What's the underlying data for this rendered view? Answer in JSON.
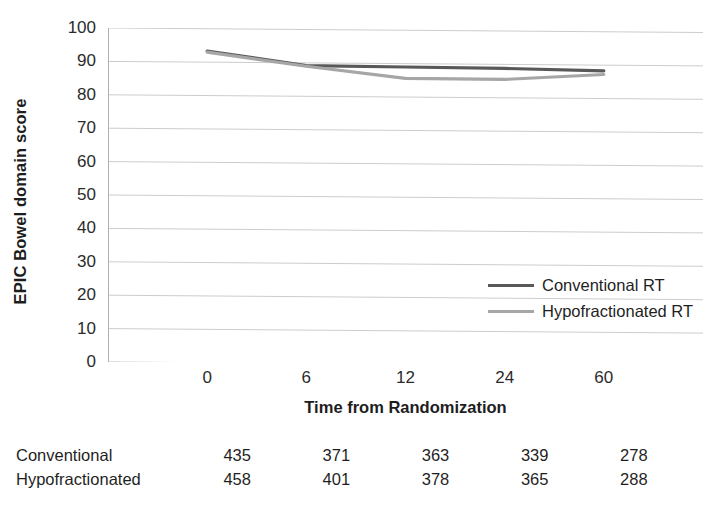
{
  "chart_data": {
    "type": "line",
    "title": "",
    "xlabel": "Time from Randomization",
    "ylabel": "EPIC Bowel domain score",
    "categories": [
      "0",
      "6",
      "12",
      "24",
      "60"
    ],
    "ylim": [
      0,
      100
    ],
    "ytick_step": 10,
    "yticks": [
      "100",
      "90",
      "80",
      "70",
      "60",
      "50",
      "40",
      "30",
      "20",
      "10",
      "0"
    ],
    "grid": true,
    "legend_position": "inside-right-middle",
    "series": [
      {
        "name": "Conventional RT",
        "color": "#595959",
        "values": [
          93.3,
          89.2,
          89.0,
          88.8,
          88.3
        ]
      },
      {
        "name": "Hypofractionated RT",
        "color": "#a6a6a6",
        "values": [
          93.0,
          89.0,
          85.6,
          85.5,
          87.2
        ]
      }
    ],
    "counts_table": {
      "rows": [
        {
          "label": "Conventional",
          "values": [
            "435",
            "371",
            "363",
            "339",
            "278"
          ]
        },
        {
          "label": "Hypofractionated",
          "values": [
            "458",
            "401",
            "378",
            "365",
            "288"
          ]
        }
      ]
    }
  },
  "legend": {
    "items": [
      {
        "label": "Conventional RT",
        "color": "#595959"
      },
      {
        "label": "Hypofractionated RT",
        "color": "#a6a6a6"
      }
    ]
  },
  "axes": {
    "y_title": "EPIC Bowel domain score",
    "x_title": "Time from Randomization"
  }
}
